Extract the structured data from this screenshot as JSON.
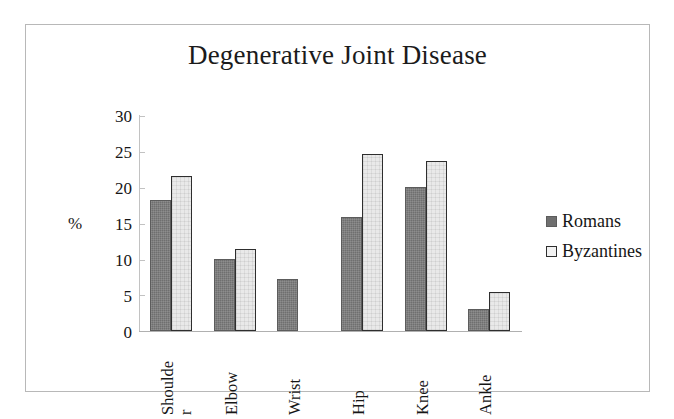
{
  "chart_data": {
    "type": "bar",
    "title": "Degenerative Joint Disease",
    "xlabel": "",
    "ylabel": "%",
    "ylim": [
      0,
      30
    ],
    "ytick_labels": [
      "30",
      "25",
      "20",
      "15",
      "10",
      "5",
      "0"
    ],
    "ytick_values": [
      30,
      25,
      20,
      15,
      10,
      5,
      0
    ],
    "grid": false,
    "legend_position": "right",
    "categories": [
      "Shoulder",
      "Elbow",
      "Wrist",
      "Hip",
      "Knee",
      "Ankle"
    ],
    "category_labels": [
      {
        "line1": "Shoulde",
        "line2": "r"
      },
      {
        "line1": "Elbow",
        "line2": ""
      },
      {
        "line1": "Wrist",
        "line2": ""
      },
      {
        "line1": "Hip",
        "line2": ""
      },
      {
        "line1": "Knee",
        "line2": ""
      },
      {
        "line1": "Ankle",
        "line2": ""
      }
    ],
    "series": [
      {
        "name": "Romans",
        "color": "#6f6f6f",
        "values": [
          18.3,
          10.1,
          7.2,
          15.9,
          20.1,
          3.1
        ]
      },
      {
        "name": "Byzantines",
        "color": "#e9e9e9",
        "values": [
          21.6,
          11.5,
          null,
          24.7,
          23.7,
          5.5
        ]
      }
    ]
  },
  "legend": {
    "items": [
      {
        "label": "Romans",
        "swatch": "romans"
      },
      {
        "label": "Byzantines",
        "swatch": "byzantines"
      }
    ]
  }
}
